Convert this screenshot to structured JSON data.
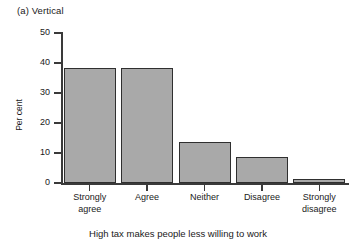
{
  "chart_data": {
    "type": "bar",
    "title": "(a) Vertical",
    "xlabel": "High tax makes people less willing to work",
    "ylabel": "Per cent",
    "categories": [
      "Strongly agree",
      "Agree",
      "Neither",
      "Disagree",
      "Strongly disagree"
    ],
    "category_lines": [
      [
        "Strongly",
        "agree"
      ],
      [
        "Agree",
        ""
      ],
      [
        "Neither",
        ""
      ],
      [
        "Disagree",
        ""
      ],
      [
        "Strongly",
        "disagree"
      ]
    ],
    "values": [
      38.5,
      38.3,
      13.8,
      8.8,
      1.5
    ],
    "ylim": [
      0,
      50
    ],
    "yticks": [
      0,
      10,
      20,
      30,
      40,
      50
    ],
    "ytick_labels": [
      "0",
      "10",
      "20",
      "30",
      "40",
      "50"
    ],
    "grid": false,
    "legend": false,
    "bar_fill_color": "#a9a9a9",
    "bar_edge_color": "#2f2f2f",
    "axis_color": "#3a3a3a",
    "background_color": "#ffffff"
  }
}
